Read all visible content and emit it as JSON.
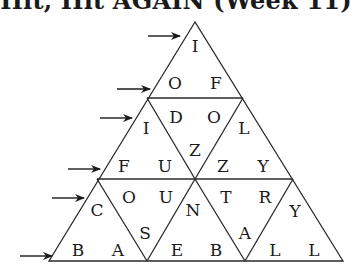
{
  "title": "Hit, Hit AGAIN (Week 11)",
  "puzzle": {
    "type": "triangle-word-grid",
    "rows": 6,
    "letters": [
      {
        "char": "I",
        "x": 195,
        "y": 46
      },
      {
        "char": "O",
        "x": 175,
        "y": 83
      },
      {
        "char": "F",
        "x": 216,
        "y": 83
      },
      {
        "char": "D",
        "x": 176,
        "y": 117
      },
      {
        "char": "O",
        "x": 214,
        "y": 117
      },
      {
        "char": "I",
        "x": 146,
        "y": 128
      },
      {
        "char": "L",
        "x": 244,
        "y": 128
      },
      {
        "char": "Z",
        "x": 195,
        "y": 150
      },
      {
        "char": "F",
        "x": 124,
        "y": 166
      },
      {
        "char": "U",
        "x": 165,
        "y": 166
      },
      {
        "char": "Z",
        "x": 223,
        "y": 166
      },
      {
        "char": "Y",
        "x": 263,
        "y": 166
      },
      {
        "char": "O",
        "x": 129,
        "y": 197
      },
      {
        "char": "U",
        "x": 166,
        "y": 197
      },
      {
        "char": "T",
        "x": 226,
        "y": 197
      },
      {
        "char": "R",
        "x": 265,
        "y": 197
      },
      {
        "char": "C",
        "x": 97,
        "y": 210
      },
      {
        "char": "N",
        "x": 193,
        "y": 210
      },
      {
        "char": "Y",
        "x": 295,
        "y": 211
      },
      {
        "char": "S",
        "x": 145,
        "y": 233
      },
      {
        "char": "A",
        "x": 245,
        "y": 233
      },
      {
        "char": "B",
        "x": 78,
        "y": 250
      },
      {
        "char": "A",
        "x": 118,
        "y": 250
      },
      {
        "char": "E",
        "x": 177,
        "y": 250
      },
      {
        "char": "B",
        "x": 216,
        "y": 250
      },
      {
        "char": "L",
        "x": 275,
        "y": 250
      },
      {
        "char": "L",
        "x": 314,
        "y": 250
      }
    ],
    "arrows": [
      {
        "row": 1,
        "x1": 148,
        "x2": 180,
        "y": 36
      },
      {
        "row": 2,
        "x1": 117,
        "x2": 150,
        "y": 89
      },
      {
        "row": 3,
        "x1": 100,
        "x2": 132,
        "y": 118
      },
      {
        "row": 4,
        "x1": 68,
        "x2": 100,
        "y": 169
      },
      {
        "row": 5,
        "x1": 52,
        "x2": 84,
        "y": 198
      },
      {
        "row": 6,
        "x1": 20,
        "x2": 52,
        "y": 256
      }
    ],
    "line_color": "#2a2a2a",
    "text_color": "#1a1a1a"
  }
}
